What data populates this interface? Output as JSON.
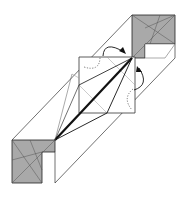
{
  "diagram": {
    "colors": {
      "background": "#ffffff",
      "paper_colored": "#a9a9a9",
      "paper_white": "#ffffff",
      "line": "#222222",
      "crease": "#6e6e6e",
      "valley_fold": "#000000"
    },
    "elements": [
      {
        "name": "top-right-colored-square",
        "type": "colored-flap"
      },
      {
        "name": "bottom-left-colored-square",
        "type": "colored-flap"
      },
      {
        "name": "center-white-square",
        "type": "white-flap"
      },
      {
        "name": "diagonal-strip",
        "type": "paper-body"
      },
      {
        "name": "fold-arrow-top",
        "type": "curved-arrow"
      },
      {
        "name": "fold-arrow-right",
        "type": "curved-arrow"
      },
      {
        "name": "thick-valley-fold-line",
        "type": "fold-line"
      },
      {
        "name": "hidden-edge-dotted-lines",
        "type": "x-ray-line"
      }
    ]
  }
}
